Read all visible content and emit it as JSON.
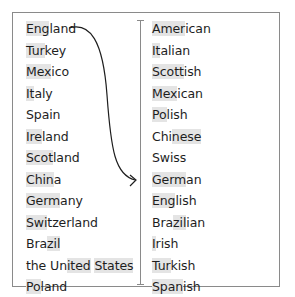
{
  "diagram": {
    "type": "matching-exercise",
    "left_column": {
      "label": "countries",
      "items": [
        {
          "pre": "",
          "hl": "Eng",
          "post": "land"
        },
        {
          "pre": "",
          "hl": "Tur",
          "post": "key"
        },
        {
          "pre": "",
          "hl": "Mex",
          "post": "ico"
        },
        {
          "pre": "",
          "hl": "It",
          "post": "aly"
        },
        {
          "pre": "",
          "hl": "",
          "post": "Spain"
        },
        {
          "pre": "",
          "hl": "Ire",
          "post": "land"
        },
        {
          "pre": "",
          "hl": "Scot",
          "post": "land"
        },
        {
          "pre": "",
          "hl": "Chin",
          "post": "a"
        },
        {
          "pre": "",
          "hl": "Germ",
          "post": "any"
        },
        {
          "pre": "",
          "hl": "Swi",
          "post": "tzerland"
        },
        {
          "pre": "Bra",
          "hl": "zil",
          "post": ""
        },
        {
          "pre": "the Un",
          "hl": "ited",
          "post": " ",
          "hl2": "States",
          "post2": ""
        },
        {
          "pre": "",
          "hl": "Po",
          "post": "land"
        }
      ]
    },
    "right_column": {
      "label": "nationalities",
      "items": [
        {
          "pre": "",
          "hl": "Amer",
          "post": "ican"
        },
        {
          "pre": "",
          "hl": "It",
          "post": "alian"
        },
        {
          "pre": "",
          "hl": "Scott",
          "post": "ish"
        },
        {
          "pre": "",
          "hl": "Mex",
          "post": "ican"
        },
        {
          "pre": "",
          "hl": "Po",
          "post": "lish"
        },
        {
          "pre": "Chi",
          "hl": "nese",
          "post": ""
        },
        {
          "pre": "",
          "hl": "",
          "post": "Swiss"
        },
        {
          "pre": "",
          "hl": "Germ",
          "post": "an"
        },
        {
          "pre": "",
          "hl": "Eng",
          "post": "lish"
        },
        {
          "pre": "Bra",
          "hl": "zil",
          "post": "ian"
        },
        {
          "pre": "",
          "hl": "I",
          "post": "rish"
        },
        {
          "pre": "",
          "hl": "Tur",
          "post": "kish"
        },
        {
          "pre": "",
          "hl": "Span",
          "post": "ish"
        }
      ]
    },
    "example_link": {
      "from": "England",
      "to": "English"
    },
    "colors": {
      "text": "#1e1e1e",
      "highlight": "#e4e4e4",
      "border": "#8a8a8a",
      "arrow": "#1e1e1e"
    }
  }
}
